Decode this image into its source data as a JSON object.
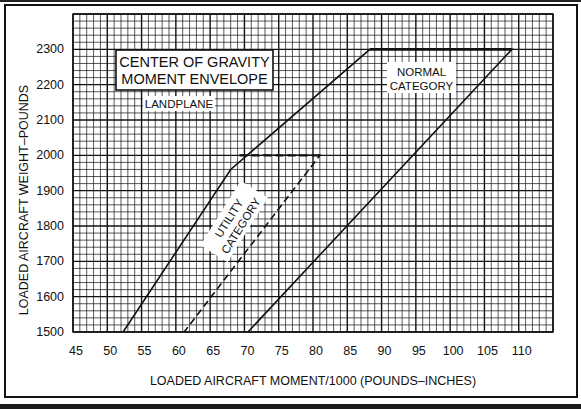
{
  "chart_data": {
    "type": "line",
    "title": "CENTER OF GRAVITY MOMENT ENVELOPE",
    "title_lines": [
      "CENTER OF GRAVITY",
      "MOMENT ENVELOPE"
    ],
    "subtitle": "LANDPLANE",
    "xlabel": "LOADED AIRCRAFT MOMENT/1000 (POUNDS–INCHES)",
    "ylabel": "LOADED AIRCRAFT WEIGHT–POUNDS",
    "xlim": [
      45,
      115
    ],
    "ylim": [
      1500,
      2400
    ],
    "x_ticks": [
      45,
      50,
      55,
      60,
      65,
      70,
      75,
      80,
      85,
      90,
      95,
      100,
      105,
      110
    ],
    "y_ticks": [
      1500,
      1600,
      1700,
      1800,
      1900,
      2000,
      2100,
      2200,
      2300
    ],
    "grid": {
      "major_x_step": 5,
      "minor_x_step": 1,
      "major_y_step": 100,
      "minor_y_step": 20
    },
    "legend": "none",
    "series": [
      {
        "name": "NORMAL CATEGORY",
        "style": "solid",
        "points": [
          [
            52.3,
            1500
          ],
          [
            68.0,
            1960
          ],
          [
            88.3,
            2300
          ],
          [
            109.0,
            2300
          ],
          [
            70.5,
            1500
          ]
        ]
      },
      {
        "name": "UTILITY CATEGORY",
        "style": "dashed",
        "points": [
          [
            69.3,
            2000
          ],
          [
            81.0,
            2000
          ],
          [
            61.2,
            1500
          ]
        ]
      }
    ],
    "annotations": [
      {
        "text": "NORMAL CATEGORY",
        "lines": [
          "NORMAL",
          "CATEGORY"
        ],
        "x": 96,
        "y": 2225
      },
      {
        "text": "UTILITY CATEGORY",
        "lines": [
          "UTILITY",
          "CATEGORY"
        ],
        "x": 67,
        "y": 1810,
        "rotation": -58
      },
      {
        "text": "LANDPLANE",
        "x": 55,
        "y": 2150
      }
    ]
  }
}
